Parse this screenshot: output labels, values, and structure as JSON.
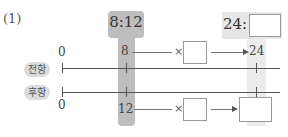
{
  "problem": {
    "number": "(1)"
  },
  "ratio_given": {
    "text": "8:12",
    "antecedent": "8",
    "consequent": "12"
  },
  "ratio_target": {
    "antecedent_label": "24:",
    "consequent_value": ""
  },
  "rows": {
    "antecedent": {
      "label": "전항",
      "zero": "0",
      "value": "8",
      "multiplier_symbol": "×",
      "multiplier_value": "",
      "result": "24"
    },
    "consequent": {
      "label": "후항",
      "zero": "0",
      "value": "12",
      "multiplier_symbol": "×",
      "multiplier_value": "",
      "result": ""
    }
  },
  "colors": {
    "highlight_dark": "#bdbdbd",
    "highlight_light": "#e6e6e6",
    "label_bg": "#dcdcdc"
  }
}
